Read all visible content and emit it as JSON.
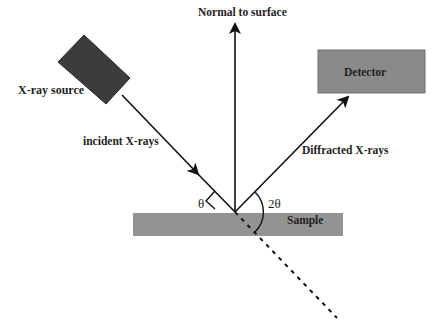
{
  "diagram": {
    "labels": {
      "normal": "Normal to surface",
      "source": "X-ray source",
      "detector": "Detector",
      "incident": "incident X-rays",
      "diffracted": "Diffracted X-rays",
      "sample": "Sample",
      "theta": "θ",
      "two_theta": "2θ"
    },
    "colors": {
      "source_fill": "#3c3c3c",
      "detector_fill": "#8a8a8a",
      "sample_fill": "#939393",
      "line": "#111111",
      "text": "#1e1e1e"
    },
    "components": [
      {
        "id": "xray-source",
        "label": "X-ray source",
        "shape": "rotated-rectangle"
      },
      {
        "id": "detector",
        "label": "Detector",
        "shape": "rectangle"
      },
      {
        "id": "sample",
        "label": "Sample",
        "shape": "rectangle"
      }
    ],
    "connections": [
      {
        "from": "xray-source",
        "to": "sample",
        "label": "incident X-rays",
        "style": "solid-arrow"
      },
      {
        "from": "sample",
        "to": "detector",
        "label": "Diffracted X-rays",
        "style": "solid-arrow"
      },
      {
        "from": "sample",
        "to": "up",
        "label": "Normal to surface",
        "style": "solid-arrow"
      },
      {
        "from": "sample",
        "to": "transmitted",
        "label": "",
        "style": "dashed"
      }
    ]
  }
}
